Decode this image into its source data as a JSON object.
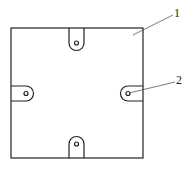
{
  "diagram": {
    "type": "technical drawing - square plate with four slotted mounting tabs",
    "callouts": [
      {
        "id": "callout-1",
        "label": "1",
        "target": "square-plate"
      },
      {
        "id": "callout-2",
        "label": "2",
        "target": "mounting-tab-hole"
      }
    ],
    "colors": {
      "line": "#222222",
      "background": "#ffffff"
    }
  }
}
